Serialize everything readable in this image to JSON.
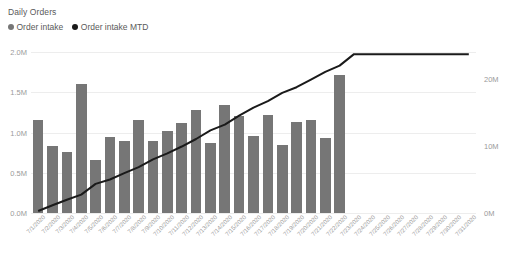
{
  "card": {
    "title": "Daily Orders",
    "background": "#ffffff"
  },
  "legend": {
    "position": "top-left",
    "items": [
      {
        "label": "Order intake",
        "color": "#767676",
        "marker": "circle"
      },
      {
        "label": "Order intake MTD",
        "color": "#1a1a1a",
        "marker": "circle"
      }
    ]
  },
  "axes": {
    "left": {
      "ticks": [
        "0.0M",
        "0.5M",
        "1.0M",
        "1.5M",
        "2.0M"
      ],
      "values": [
        0,
        500000,
        1000000,
        1500000,
        2000000
      ],
      "min": 0,
      "max": 2000000
    },
    "right": {
      "ticks": [
        "0M",
        "10M",
        "20M"
      ],
      "values": [
        0,
        10000000,
        20000000
      ],
      "min": 0,
      "max": 24000000
    }
  },
  "chart_data": {
    "type": "bar",
    "title": "Daily Orders",
    "xlabel": "",
    "ylabel": "",
    "ylim": [
      0,
      2000000
    ],
    "y2lim": [
      0,
      24000000
    ],
    "grid": true,
    "legend_position": "top-left",
    "categories": [
      "7/1/2020",
      "7/2/2020",
      "7/3/2020",
      "7/4/2020",
      "7/5/2020",
      "7/6/2020",
      "7/7/2020",
      "7/8/2020",
      "7/9/2020",
      "7/10/2020",
      "7/11/2020",
      "7/12/2020",
      "7/13/2020",
      "7/14/2020",
      "7/15/2020",
      "7/16/2020",
      "7/17/2020",
      "7/18/2020",
      "7/19/2020",
      "7/20/2020",
      "7/21/2020",
      "7/22/2020",
      "7/23/2020",
      "7/24/2020",
      "7/25/2020",
      "7/26/2020",
      "7/27/2020",
      "7/28/2020",
      "7/29/2020",
      "7/30/2020",
      "7/31/2020"
    ],
    "series": [
      {
        "name": "Order intake",
        "type": "bar",
        "axis": "left",
        "color": "#767676",
        "values": [
          1150000,
          830000,
          760000,
          1600000,
          660000,
          940000,
          890000,
          1160000,
          900000,
          1020000,
          1120000,
          1280000,
          870000,
          1340000,
          1200000,
          960000,
          1220000,
          850000,
          1130000,
          1160000,
          930000,
          1710000,
          null,
          null,
          null,
          null,
          null,
          null,
          null,
          null,
          null
        ]
      },
      {
        "name": "Order intake MTD",
        "type": "line",
        "axis": "right",
        "color": "#1a1a1a",
        "values": [
          300000,
          1150000,
          1980000,
          2740000,
          4340000,
          5000000,
          5940000,
          6830000,
          7990000,
          8890000,
          9910000,
          11030000,
          12310000,
          13180000,
          14520000,
          15720000,
          16680000,
          17900000,
          18750000,
          19880000,
          21040000,
          21970000,
          23680000,
          23680000,
          23680000,
          23680000,
          23680000,
          23680000,
          23680000,
          23680000,
          23680000
        ]
      }
    ]
  }
}
